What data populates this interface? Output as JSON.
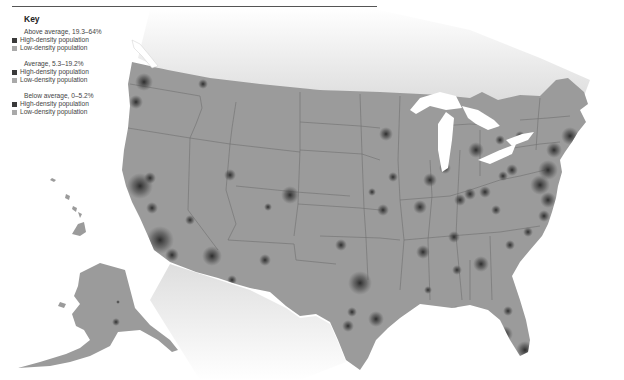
{
  "header": {
    "title_fragment": "…population density…"
  },
  "key": {
    "title": "Key",
    "groups": [
      {
        "label": "Above average, 19.3–64%",
        "items": [
          {
            "label": "High-density population",
            "color": "#3a3a3a"
          },
          {
            "label": "Low-density population",
            "color": "#a9a9a9"
          }
        ]
      },
      {
        "label": "Average, 5.3–19.2%",
        "items": [
          {
            "label": "High-density population",
            "color": "#3a3a3a"
          },
          {
            "label": "Low-density population",
            "color": "#a9a9a9"
          }
        ]
      },
      {
        "label": "Below average, 0–5.2%",
        "items": [
          {
            "label": "High-density population",
            "color": "#3a3a3a"
          },
          {
            "label": "Low-density population",
            "color": "#a9a9a9"
          }
        ]
      }
    ]
  },
  "map": {
    "land_color": "#9b9b9b",
    "border_color": "#6e6e6e",
    "water_color": "#ffffff",
    "hotspot_color": "#2f2f2f",
    "regions": [
      "Contiguous United States",
      "Alaska",
      "Hawaii",
      "Great Lakes"
    ]
  }
}
